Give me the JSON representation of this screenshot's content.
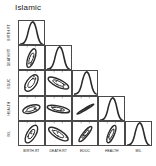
{
  "title": "Islamic",
  "variables": [
    "BIRTH.RT",
    "DEATH.RT",
    "EDUC",
    "HEALTH",
    "MIL"
  ],
  "axis": {
    "x_labels": [
      "BIRTH.RT",
      "DEATH.RT",
      "EDUC",
      "HEALTH",
      "MIL"
    ],
    "y_labels": [
      "BIRTH.RT",
      "DEATH.RT",
      "EDUC",
      "HEALTH",
      "MIL"
    ]
  },
  "chart_data": {
    "type": "scatter",
    "title": "Islamic",
    "subtitle": "",
    "xlabel": "",
    "ylabel": "",
    "layout": "lower-triangular scatterplot matrix with density curves on the diagonal and data-concentration ellipses off-diagonal",
    "grid": true,
    "legend": "none",
    "categories": [
      "BIRTH.RT",
      "DEATH.RT",
      "EDUC",
      "HEALTH",
      "MIL"
    ],
    "diagonal": [
      {
        "variable": "BIRTH.RT",
        "plot": "density",
        "shape": "right-skewed peak at high values"
      },
      {
        "variable": "DEATH.RT",
        "plot": "density",
        "shape": "right-skewed peak at high values"
      },
      {
        "variable": "EDUC",
        "plot": "density",
        "shape": "right-skewed peak at high values"
      },
      {
        "variable": "HEALTH",
        "plot": "density",
        "shape": "right-skewed peak at high values"
      },
      {
        "variable": "MIL",
        "plot": "density",
        "shape": "right-skewed peak at high values"
      }
    ],
    "panels": [
      {
        "row": "DEATH.RT",
        "col": "BIRTH.RT",
        "correlation": 0.55,
        "ellipse": {
          "angle": -72,
          "rx": 0.42,
          "ry": 0.14
        },
        "points": 4
      },
      {
        "row": "EDUC",
        "col": "BIRTH.RT",
        "correlation": 0.5,
        "ellipse": {
          "angle": -58,
          "rx": 0.4,
          "ry": 0.2
        },
        "points": 5
      },
      {
        "row": "EDUC",
        "col": "DEATH.RT",
        "correlation": -0.62,
        "ellipse": {
          "angle": 28,
          "rx": 0.46,
          "ry": 0.16
        },
        "points": 5
      },
      {
        "row": "HEALTH",
        "col": "BIRTH.RT",
        "correlation": 0.32,
        "ellipse": {
          "angle": -18,
          "rx": 0.36,
          "ry": 0.16
        },
        "points": 4
      },
      {
        "row": "HEALTH",
        "col": "DEATH.RT",
        "correlation": -0.35,
        "ellipse": {
          "angle": 12,
          "rx": 0.46,
          "ry": 0.13
        },
        "points": 5
      },
      {
        "row": "HEALTH",
        "col": "EDUC",
        "correlation": 0.95,
        "ellipse": {
          "angle": -32,
          "rx": 0.4,
          "ry": 0.04
        },
        "points": 3
      },
      {
        "row": "MIL",
        "col": "BIRTH.RT",
        "correlation": 0.58,
        "ellipse": {
          "angle": -62,
          "rx": 0.42,
          "ry": 0.18
        },
        "points": 5
      },
      {
        "row": "MIL",
        "col": "DEATH.RT",
        "correlation": -0.6,
        "ellipse": {
          "angle": 34,
          "rx": 0.46,
          "ry": 0.17
        },
        "points": 5
      },
      {
        "row": "MIL",
        "col": "EDUC",
        "correlation": 0.82,
        "ellipse": {
          "angle": -52,
          "rx": 0.4,
          "ry": 0.1
        },
        "points": 4
      },
      {
        "row": "MIL",
        "col": "HEALTH",
        "correlation": 0.78,
        "ellipse": {
          "angle": -68,
          "rx": 0.4,
          "ry": 0.12
        },
        "points": 3
      }
    ]
  },
  "colors": {
    "frame": "#4a4a4a",
    "ink": "#1a1a1a",
    "background": "#ffffff"
  }
}
